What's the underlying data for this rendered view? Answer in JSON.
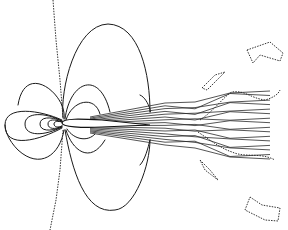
{
  "chart_data": {
    "type": "contour",
    "title": "",
    "xlabel": "",
    "ylabel": "",
    "grid": false,
    "legend": null,
    "colors": {
      "line": "#1a1a1a",
      "dashed": "#333333",
      "background": "#ffffff"
    },
    "airfoil": {
      "leading_edge": [
        62,
        123
      ],
      "trailing_edge": [
        150,
        125
      ],
      "thickness": 8
    },
    "solid_contours": [
      "M62,120 C40,110 5,105 5,125 C5,150 40,140 62,128",
      "M62,121 C45,112 25,112 25,124 C25,137 45,136 62,127",
      "M62,121 C50,116 40,117 40,124 C40,131 50,132 62,127",
      "M62,122 C55,119 48,119 48,124 C48,129 55,130 62,126",
      "M62,122 C58,121 54,121 54,124 C54,127 58,128 62,126",
      "M63,118 C60,90 75,25 108,24 C140,25 150,75 150,112",
      "M64,119 C68,95 25,60 18,105",
      "M65,119 C70,80 100,70 110,112",
      "M66,120 C72,100 95,95 100,114",
      "M64,130 C60,155 40,170 18,150 C8,140 5,130 5,125",
      "M65,130 C72,170 85,215 115,210 C135,208 150,165 150,140",
      "M66,130 C72,150 90,165 105,140",
      "M67,129 C74,140 88,142 95,134",
      "M150,112 C152,115 148,98 140,95",
      "M150,140 C148,148 145,160 140,165"
    ],
    "dotted_contours": [
      "M53,0 L56,40 L60,80 L63,118",
      "M63,130 L60,170 L56,200 L50,230",
      "M200,120 C215,110 225,95 232,92 C245,90 250,98 265,100 C272,98 278,95 280,90",
      "M198,132 C210,140 220,148 232,152 C245,158 260,152 275,160",
      "M202,88 L215,75 L225,72 L207,90 Z",
      "M200,160 L210,170 L218,180 L205,170 Z",
      "M247,50 L270,42 L283,53 L280,61 L260,55 L253,63 Z",
      "M250,197 L262,205 L280,208 L278,221 L265,220 L245,210 Z"
    ],
    "wake": {
      "x_start": 90,
      "x_end": 280,
      "y_center": 125,
      "spread_start": 8,
      "spread_end": 34,
      "count": 16
    }
  }
}
